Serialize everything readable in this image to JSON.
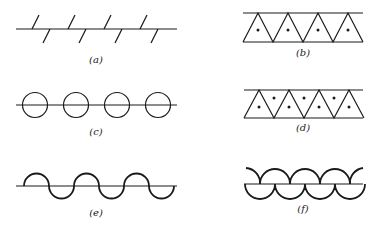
{
  "figure": {
    "panels": [
      {
        "id": "a",
        "label": "(a)",
        "description": "line with alternating slanted ticks above and below"
      },
      {
        "id": "b",
        "label": "(b)",
        "description": "row of upward triangles between two lines, one dot each"
      },
      {
        "id": "c",
        "label": "(c)",
        "description": "line through a row of four circles"
      },
      {
        "id": "d",
        "label": "(d)",
        "description": "row of triangles between two lines, dots in upright and inverted triangles"
      },
      {
        "id": "e",
        "label": "(e)",
        "description": "sinusoidal wave of alternating semicircles across a line"
      },
      {
        "id": "f",
        "label": "(f)",
        "description": "line with upper arcs and lower semicircles"
      }
    ]
  }
}
